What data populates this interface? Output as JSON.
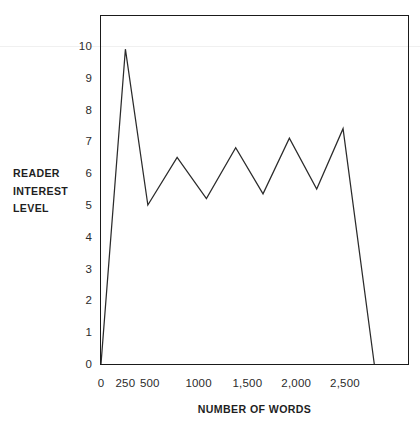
{
  "chart_data": {
    "type": "line",
    "title": "",
    "xlabel": "NUMBER OF WORDS",
    "ylabel_lines": [
      "READER",
      "INTEREST",
      "LEVEL"
    ],
    "ylabel": "READER INTEREST LEVEL",
    "xlim": [
      0,
      2800
    ],
    "ylim": [
      0,
      11
    ],
    "grid": false,
    "legend": null,
    "line_color": "#2b2b2b",
    "x_tick_values": [
      0,
      250,
      500,
      1000,
      1500,
      2000,
      2500
    ],
    "x_tick_labels": [
      "0",
      "250",
      "500",
      "1000",
      "1,500",
      "2,000",
      "2,500"
    ],
    "y_tick_values": [
      0,
      1,
      2,
      3,
      4,
      5,
      6,
      7,
      8,
      9,
      10
    ],
    "y_tick_labels": [
      "0",
      "1",
      "2",
      "3",
      "4",
      "5",
      "6",
      "7",
      "8",
      "9",
      "10"
    ],
    "x": [
      0,
      250,
      480,
      780,
      1080,
      1380,
      1660,
      1930,
      2210,
      2480,
      2800
    ],
    "values": [
      0,
      9.9,
      5.0,
      6.5,
      5.2,
      6.8,
      5.35,
      7.1,
      5.5,
      7.4,
      0
    ],
    "points": [
      {
        "x": 0,
        "y": 0
      },
      {
        "x": 250,
        "y": 9.9
      },
      {
        "x": 480,
        "y": 5.0
      },
      {
        "x": 780,
        "y": 6.5
      },
      {
        "x": 1080,
        "y": 5.2
      },
      {
        "x": 1380,
        "y": 6.8
      },
      {
        "x": 1660,
        "y": 5.35
      },
      {
        "x": 1930,
        "y": 7.1
      },
      {
        "x": 2210,
        "y": 5.5
      },
      {
        "x": 2480,
        "y": 7.4
      },
      {
        "x": 2800,
        "y": 0
      }
    ]
  }
}
